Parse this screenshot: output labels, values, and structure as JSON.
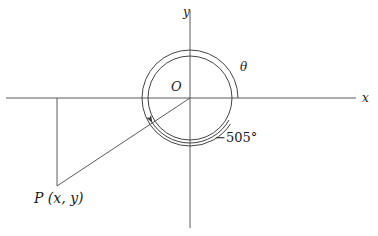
{
  "figure": {
    "type": "math-diagram",
    "background_color": "#ffffff",
    "stroke_color": "#3a3a3a",
    "text_color": "#1a1a1a"
  },
  "labels": {
    "x_axis": "x",
    "y_axis": "y",
    "origin": "O",
    "theta": "θ",
    "angle_measure": "−505°",
    "point": "P (x, y)"
  },
  "geometry": {
    "origin": {
      "x": 190,
      "y": 98
    },
    "inner_circle_radius": 42,
    "outer_arc_radius": 48,
    "terminal_point": {
      "x": 57,
      "y": 186
    },
    "terminal_angle_degrees": -505,
    "x_axis": {
      "x1": 6,
      "x2": 356,
      "y": 98
    },
    "y_axis": {
      "y1": 10,
      "y2": 228,
      "x": 190
    },
    "drop_line": {
      "x": 57,
      "y1": 98,
      "y2": 186
    }
  },
  "label_positions": {
    "x_axis": {
      "x": 362,
      "y": 92
    },
    "y_axis": {
      "x": 183,
      "y": 6
    },
    "origin": {
      "x": 171,
      "y": 80
    },
    "theta": {
      "x": 240,
      "y": 61
    },
    "angle": {
      "x": 215,
      "y": 131
    },
    "point": {
      "x": 34,
      "y": 191
    }
  }
}
